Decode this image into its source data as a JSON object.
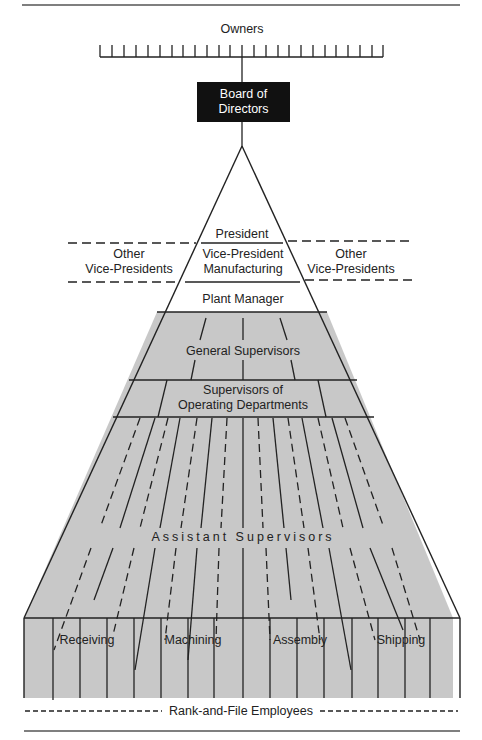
{
  "diagram": {
    "title_top": "Owners",
    "board": {
      "line1": "Board of",
      "line2": "Directors"
    },
    "pyramid_levels": [
      {
        "id": "president",
        "label": "President"
      },
      {
        "id": "vp_manufacturing",
        "line1": "Vice-President",
        "line2": "Manufacturing"
      },
      {
        "id": "plant_manager",
        "label": "Plant Manager"
      },
      {
        "id": "general_supervisors",
        "label": "General Supervisors"
      },
      {
        "id": "supervisors_operating",
        "line1": "Supervisors of",
        "line2": "Operating Departments"
      },
      {
        "id": "assistant_supervisors",
        "label": "Assistant Supervisors"
      }
    ],
    "other_vps_left": {
      "line1": "Other",
      "line2": "Vice-Presidents"
    },
    "other_vps_right": {
      "line1": "Other",
      "line2": "Vice-Presidents"
    },
    "departments": [
      "Receiving",
      "Machining",
      "Assembly",
      "Shipping"
    ],
    "base_label": "Rank-and-File Employees",
    "colors": {
      "fill_gray": "#c8c8c8",
      "line": "#222222",
      "board_fill": "#111111"
    }
  }
}
